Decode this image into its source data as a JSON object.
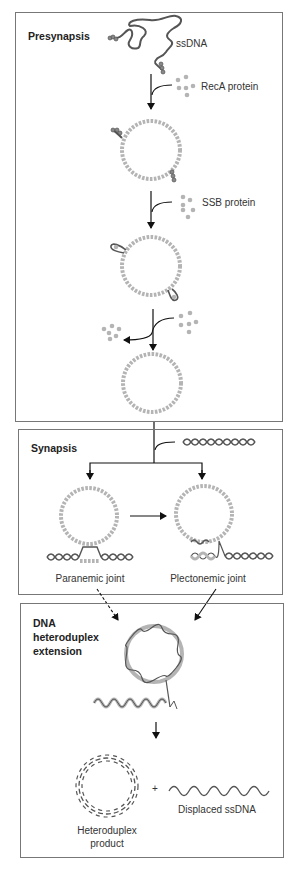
{
  "figure": {
    "colors": {
      "protein": "#b4b4b4",
      "strand": "#555555",
      "box_border": "#777777",
      "arrow": "#111111"
    },
    "panels": [
      {
        "title": "Presynapsis",
        "labels": {
          "ssdna": "ssDNA",
          "reca": "RecA protein",
          "ssb": "SSB protein"
        }
      },
      {
        "title": "Synapsis",
        "labels": {
          "paranemic": "Paranemic joint",
          "plectonemic": "Plectonemic joint"
        }
      },
      {
        "title_lines": [
          "DNA",
          "heteroduplex",
          "extension"
        ],
        "labels": {
          "plus": "+",
          "displaced": "Displaced ssDNA",
          "product_line1": "Heteroduplex",
          "product_line2": "product"
        }
      }
    ]
  }
}
